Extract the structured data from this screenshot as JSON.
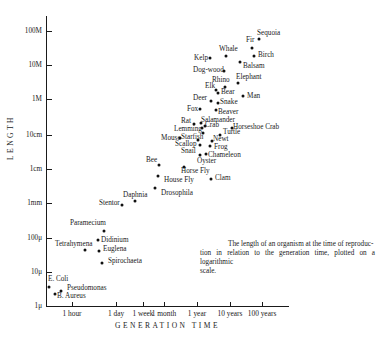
{
  "chart_data": {
    "type": "scatter",
    "title": "",
    "xlabel": "GENERATION TIME",
    "ylabel": "LENGTH",
    "x_scale": "log",
    "y_scale": "log",
    "x_ticks": [
      "1 hour",
      "1 day",
      "1 week",
      "1 month",
      "1 year",
      "10 years",
      "100 years"
    ],
    "y_ticks": [
      "1μ",
      "10μ",
      "100μ",
      "1mm",
      "1cm",
      "10cm",
      "1M",
      "10M",
      "100M"
    ],
    "caption": "The length of an organism at the time of reproduction in relation to the generation time, plotted on a logarithmic scale.",
    "grid": false,
    "points": [
      {
        "label": "E. Coli",
        "x_approx": "20 min",
        "y_approx": "3.5μ"
      },
      {
        "label": "B. Aureus",
        "x_approx": "30 min",
        "y_approx": "2μ"
      },
      {
        "label": "Pseudomonas",
        "x_approx": "40 min",
        "y_approx": "3μ"
      },
      {
        "label": "Tetrahymena",
        "x_approx": "4 hours",
        "y_approx": "50μ"
      },
      {
        "label": "Paramecium",
        "x_approx": "18 hours",
        "y_approx": "200μ"
      },
      {
        "label": "Didinium",
        "x_approx": "12 hours",
        "y_approx": "100μ"
      },
      {
        "label": "Euglena",
        "x_approx": "12 hours",
        "y_approx": "40μ"
      },
      {
        "label": "Spirochaeta",
        "x_approx": "15 hours",
        "y_approx": "20μ"
      },
      {
        "label": "Stentor",
        "x_approx": "2 days",
        "y_approx": "1mm"
      },
      {
        "label": "Daphnia",
        "x_approx": "5 days",
        "y_approx": "1.4mm"
      },
      {
        "label": "Drosophila",
        "x_approx": "2 weeks",
        "y_approx": "3mm"
      },
      {
        "label": "House Fly",
        "x_approx": "3 weeks",
        "y_approx": "6mm"
      },
      {
        "label": "Bee",
        "x_approx": "3 weeks",
        "y_approx": "1.3cm"
      },
      {
        "label": "Horse Fly",
        "x_approx": "2 months",
        "y_approx": "1.2cm"
      },
      {
        "label": "Clam",
        "x_approx": "1.5 years",
        "y_approx": "6mm"
      },
      {
        "label": "Oyster",
        "x_approx": "4 months",
        "y_approx": "3cm"
      },
      {
        "label": "Snail",
        "x_approx": "3 months",
        "y_approx": "4cm"
      },
      {
        "label": "Chameleon",
        "x_approx": "6 months",
        "y_approx": "4cm"
      },
      {
        "label": "Scallop",
        "x_approx": "3 months",
        "y_approx": "5cm"
      },
      {
        "label": "Mouse",
        "x_approx": "1 month",
        "y_approx": "7cm"
      },
      {
        "label": "Starfish",
        "x_approx": "4 months",
        "y_approx": "8cm"
      },
      {
        "label": "Frog",
        "x_approx": "1 year",
        "y_approx": "6cm"
      },
      {
        "label": "Newt",
        "x_approx": "1.2 years",
        "y_approx": "8cm"
      },
      {
        "label": "Lemming",
        "x_approx": "2 months",
        "y_approx": "10cm"
      },
      {
        "label": "Crab",
        "x_approx": "4 months",
        "y_approx": "12cm"
      },
      {
        "label": "Turtle",
        "x_approx": "3 years",
        "y_approx": "10cm"
      },
      {
        "label": "Salamander",
        "x_approx": "5 months",
        "y_approx": "15cm"
      },
      {
        "label": "Rat",
        "x_approx": "3 months",
        "y_approx": "20cm"
      },
      {
        "label": "Horseshoe Crab",
        "x_approx": "8 years",
        "y_approx": "15cm"
      },
      {
        "label": "Fox",
        "x_approx": "8 months",
        "y_approx": "50cm"
      },
      {
        "label": "Beaver",
        "x_approx": "2 years",
        "y_approx": "60cm"
      },
      {
        "label": "Deer",
        "x_approx": "1.5 years",
        "y_approx": "1M"
      },
      {
        "label": "Snake",
        "x_approx": "3 years",
        "y_approx": "1M"
      },
      {
        "label": "Bear",
        "x_approx": "4 years",
        "y_approx": "1.5M"
      },
      {
        "label": "Elk",
        "x_approx": "3 years",
        "y_approx": "2M"
      },
      {
        "label": "Rhino",
        "x_approx": "6 years",
        "y_approx": "2.5M"
      },
      {
        "label": "Man",
        "x_approx": "20 years",
        "y_approx": "1.7M"
      },
      {
        "label": "Elephant",
        "x_approx": "15 years",
        "y_approx": "4M"
      },
      {
        "label": "Dog-wood",
        "x_approx": "8 years",
        "y_approx": "8M"
      },
      {
        "label": "Balsam",
        "x_approx": "20 years",
        "y_approx": "12M"
      },
      {
        "label": "Kelp",
        "x_approx": "1 year",
        "y_approx": "15M"
      },
      {
        "label": "Whale",
        "x_approx": "10 years",
        "y_approx": "20M"
      },
      {
        "label": "Birch",
        "x_approx": "60 years",
        "y_approx": "20M"
      },
      {
        "label": "Fir",
        "x_approx": "50 years",
        "y_approx": "40M"
      },
      {
        "label": "Sequoia",
        "x_approx": "100 years",
        "y_approx": "70M"
      }
    ]
  },
  "axes": {
    "ylabel": "LENGTH",
    "xlabel": "GENERATION TIME",
    "yticks": [
      {
        "label": "100M",
        "y": 31
      },
      {
        "label": "10M",
        "y": 65
      },
      {
        "label": "1M",
        "y": 99
      },
      {
        "label": "10cm",
        "y": 135
      },
      {
        "label": "1cm",
        "y": 169
      },
      {
        "label": "1mm",
        "y": 203
      },
      {
        "label": "100μ",
        "y": 238
      },
      {
        "label": "10μ",
        "y": 272
      },
      {
        "label": "1μ",
        "y": 306
      }
    ],
    "xticks": [
      {
        "label": "1 hour",
        "x": 72
      },
      {
        "label": "1 day",
        "x": 116
      },
      {
        "label": "1 week",
        "x": 143
      },
      {
        "label": "1 month",
        "x": 164
      },
      {
        "label": "1 year",
        "x": 197
      },
      {
        "label": "10 years",
        "x": 230
      },
      {
        "label": "100 years",
        "x": 262
      }
    ]
  },
  "points": [
    {
      "label": "E. Coli",
      "x": 49,
      "y": 287,
      "lx": 48,
      "ly": 276
    },
    {
      "label": "B. Aureus",
      "x": 55,
      "y": 294,
      "lx": 57,
      "ly": 293
    },
    {
      "label": "Pseudomonas",
      "x": 61,
      "y": 291,
      "lx": 67,
      "ly": 285
    },
    {
      "label": "Tetrahymena",
      "x": 85,
      "y": 250,
      "lx": 55,
      "ly": 241
    },
    {
      "label": "Paramecium",
      "x": 104,
      "y": 231,
      "lx": 70,
      "ly": 220
    },
    {
      "label": "Didinium",
      "x": 98,
      "y": 240,
      "lx": 101,
      "ly": 237
    },
    {
      "label": "Euglena",
      "x": 99,
      "y": 251,
      "lx": 103,
      "ly": 246
    },
    {
      "label": "Spirochaeta",
      "x": 102,
      "y": 263,
      "lx": 108,
      "ly": 258
    },
    {
      "label": "Stentor",
      "x": 122,
      "y": 205,
      "lx": 99,
      "ly": 200
    },
    {
      "label": "Daphnia",
      "x": 135,
      "y": 201,
      "lx": 123,
      "ly": 192
    },
    {
      "label": "Drosophila",
      "x": 155,
      "y": 188,
      "lx": 161,
      "ly": 190
    },
    {
      "label": "House Fly",
      "x": 158,
      "y": 176,
      "lx": 164,
      "ly": 177
    },
    {
      "label": "Bee",
      "x": 159,
      "y": 165,
      "lx": 146,
      "ly": 157
    },
    {
      "label": "Horse Fly",
      "x": 184,
      "y": 167,
      "lx": 181,
      "ly": 168
    },
    {
      "label": "Clam",
      "x": 211,
      "y": 179,
      "lx": 215,
      "ly": 175
    },
    {
      "label": "Oyster",
      "x": 200,
      "y": 155,
      "lx": 197,
      "ly": 158
    },
    {
      "label": "Snail",
      "x": 200,
      "y": 145,
      "lx": 181,
      "ly": 148
    },
    {
      "label": "Chameleon",
      "x": 206,
      "y": 154,
      "lx": 208,
      "ly": 152
    },
    {
      "label": "Scallop",
      "x": 198,
      "y": 140,
      "lx": 175,
      "ly": 141
    },
    {
      "label": "Mouse",
      "x": 180,
      "y": 138,
      "lx": 161,
      "ly": 135
    },
    {
      "label": "Starfish",
      "x": 203,
      "y": 133,
      "lx": 181,
      "ly": 134
    },
    {
      "label": "Frog",
      "x": 210,
      "y": 146,
      "lx": 214,
      "ly": 144
    },
    {
      "label": "Newt",
      "x": 212,
      "y": 141,
      "lx": 213,
      "ly": 136
    },
    {
      "label": "Lemming",
      "x": 202,
      "y": 128,
      "lx": 174,
      "ly": 126
    },
    {
      "label": "Crab",
      "x": 205,
      "y": 126,
      "lx": 205,
      "ly": 122
    },
    {
      "label": "Turtle",
      "x": 220,
      "y": 135,
      "lx": 223,
      "ly": 129
    },
    {
      "label": "Salamander",
      "x": 201,
      "y": 123,
      "lx": 201,
      "ly": 117
    },
    {
      "label": "Rat",
      "x": 194,
      "y": 124,
      "lx": 181,
      "ly": 118
    },
    {
      "label": "Horseshoe Crab",
      "x": 232,
      "y": 128,
      "lx": 233,
      "ly": 124
    },
    {
      "label": "Fox",
      "x": 200,
      "y": 109,
      "lx": 187,
      "ly": 106
    },
    {
      "label": "Beaver",
      "x": 216,
      "y": 110,
      "lx": 218,
      "ly": 109
    },
    {
      "label": "Deer",
      "x": 211,
      "y": 101,
      "lx": 193,
      "ly": 95
    },
    {
      "label": "Snake",
      "x": 218,
      "y": 103,
      "lx": 220,
      "ly": 99
    },
    {
      "label": "Bear",
      "x": 218,
      "y": 93,
      "lx": 221,
      "ly": 89
    },
    {
      "label": "Elk",
      "x": 216,
      "y": 90,
      "lx": 205,
      "ly": 83
    },
    {
      "label": "Rhino",
      "x": 225,
      "y": 87,
      "lx": 212,
      "ly": 77
    },
    {
      "label": "Man",
      "x": 243,
      "y": 96,
      "lx": 247,
      "ly": 93
    },
    {
      "label": "Elephant",
      "x": 238,
      "y": 83,
      "lx": 236,
      "ly": 74
    },
    {
      "label": "Dog-wood",
      "x": 224,
      "y": 71,
      "lx": 193,
      "ly": 67
    },
    {
      "label": "Balsam",
      "x": 240,
      "y": 62,
      "lx": 243,
      "ly": 63
    },
    {
      "label": "Kelp",
      "x": 210,
      "y": 58,
      "lx": 194,
      "ly": 55
    },
    {
      "label": "Whale",
      "x": 226,
      "y": 56,
      "lx": 219,
      "ly": 46
    },
    {
      "label": "Birch",
      "x": 254,
      "y": 56,
      "lx": 258,
      "ly": 52
    },
    {
      "label": "Fir",
      "x": 252,
      "y": 48,
      "lx": 246,
      "ly": 37
    },
    {
      "label": "Sequoia",
      "x": 259,
      "y": 39,
      "lx": 257,
      "ly": 30
    }
  ],
  "caption": {
    "line1": "The length of an organism at the time of reproduc-",
    "line2": "tion in relation to the generation time, plotted on a logarithmic",
    "line3": "scale."
  }
}
